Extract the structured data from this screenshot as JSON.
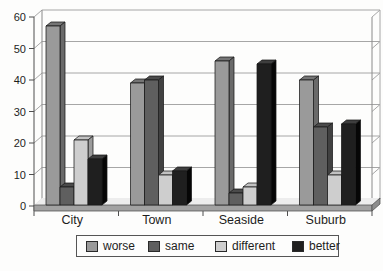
{
  "chart_data": {
    "type": "bar",
    "variant": "3d-column",
    "title": "",
    "xlabel": "",
    "ylabel": "",
    "categories": [
      "City",
      "Town",
      "Seaside",
      "Suburb"
    ],
    "series": [
      {
        "name": "worse",
        "values": [
          57,
          39,
          46,
          40
        ],
        "color": "#9a9a9a",
        "top_color": "#757575",
        "side_color": "#6a6a6a"
      },
      {
        "name": "same",
        "values": [
          6,
          40,
          4,
          25
        ],
        "color": "#5f5f5f",
        "top_color": "#4b4b4b",
        "side_color": "#414141"
      },
      {
        "name": "different",
        "values": [
          21,
          10,
          6,
          10
        ],
        "color": "#cecece",
        "top_color": "#c2c2c2",
        "side_color": "#9b9b9b"
      },
      {
        "name": "better",
        "values": [
          15,
          11,
          45,
          26
        ],
        "color": "#1f1f1f",
        "top_color": "#3e3e3e",
        "side_color": "#060606"
      }
    ],
    "ylim": [
      0,
      60
    ],
    "yticks": [
      0,
      10,
      20,
      30,
      40,
      50,
      60
    ],
    "grid": true,
    "legend_position": "bottom",
    "colors": {
      "gridline": "#a6a6a6",
      "axis": "#4f4f4f",
      "wall_edge": "#8a8a8a",
      "floor_front": "#a2a2a2",
      "floor_end": "#8d8d8d",
      "floor_surface": "#ededed",
      "bar_outline": "#1a1a1a",
      "text": "#1d1d1d"
    }
  }
}
